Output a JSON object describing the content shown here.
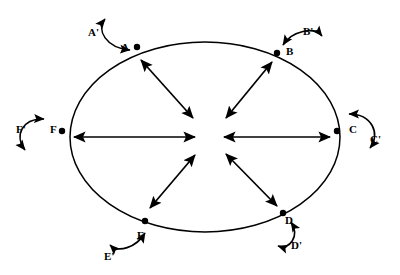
{
  "figure": {
    "type": "node-link-diagram",
    "shape": "ellipse",
    "stroke_color": "#000000",
    "background_color": "#ffffff"
  },
  "ellipse": {
    "cx": 205,
    "cy": 137,
    "rx": 135,
    "ry": 95
  },
  "center_hub": {
    "left_converge_x": 197,
    "right_converge_x": 222,
    "y": 137
  },
  "vertices": [
    {
      "id": "A",
      "label": "A",
      "label_x": 121,
      "label_y": 42,
      "dot_x": 137,
      "dot_y": 47,
      "loop_label": "A'",
      "loop_label_x": 88,
      "loop_label_y": 27
    },
    {
      "id": "B",
      "label": "B",
      "label_x": 286,
      "label_y": 46,
      "dot_x": 277,
      "dot_y": 53,
      "loop_label": "B'",
      "loop_label_x": 303,
      "loop_label_y": 26
    },
    {
      "id": "C",
      "label": "C",
      "label_x": 349,
      "label_y": 124,
      "dot_x": 337,
      "dot_y": 131,
      "loop_label": "C'",
      "loop_label_x": 370,
      "loop_label_y": 134
    },
    {
      "id": "D",
      "label": "D",
      "label_x": 285,
      "label_y": 215,
      "dot_x": 283,
      "dot_y": 213,
      "loop_label": "D'",
      "loop_label_x": 291,
      "loop_label_y": 240
    },
    {
      "id": "E",
      "label": "E",
      "label_x": 137,
      "label_y": 230,
      "dot_x": 145,
      "dot_y": 221,
      "loop_label": "E'",
      "loop_label_x": 104,
      "loop_label_y": 251
    },
    {
      "id": "F",
      "label": "F",
      "label_x": 50,
      "label_y": 124,
      "dot_x": 62,
      "dot_y": 131,
      "loop_label": "F'",
      "loop_label_x": 16,
      "loop_label_y": 124
    }
  ],
  "radial_arrows": [
    {
      "from": "A",
      "x1": 141,
      "y1": 60,
      "x2": 193,
      "y2": 118,
      "double_headed": true
    },
    {
      "from": "B",
      "x1": 272,
      "y1": 62,
      "x2": 226,
      "y2": 118,
      "double_headed": true
    },
    {
      "from": "C",
      "x1": 330,
      "y1": 137,
      "x2": 224,
      "y2": 137,
      "double_headed": true
    },
    {
      "from": "D",
      "x1": 277,
      "y1": 206,
      "x2": 226,
      "y2": 154,
      "double_headed": true
    },
    {
      "from": "E",
      "x1": 150,
      "y1": 208,
      "x2": 195,
      "y2": 155,
      "double_headed": true
    },
    {
      "from": "F",
      "x1": 74,
      "y1": 137,
      "x2": 195,
      "y2": 137,
      "double_headed": true
    }
  ],
  "self_loops": [
    {
      "vertex": "A",
      "orientation": "up-left"
    },
    {
      "vertex": "B",
      "orientation": "up-right"
    },
    {
      "vertex": "C",
      "orientation": "right"
    },
    {
      "vertex": "D",
      "orientation": "down-right"
    },
    {
      "vertex": "E",
      "orientation": "down-left"
    },
    {
      "vertex": "F",
      "orientation": "left"
    }
  ]
}
